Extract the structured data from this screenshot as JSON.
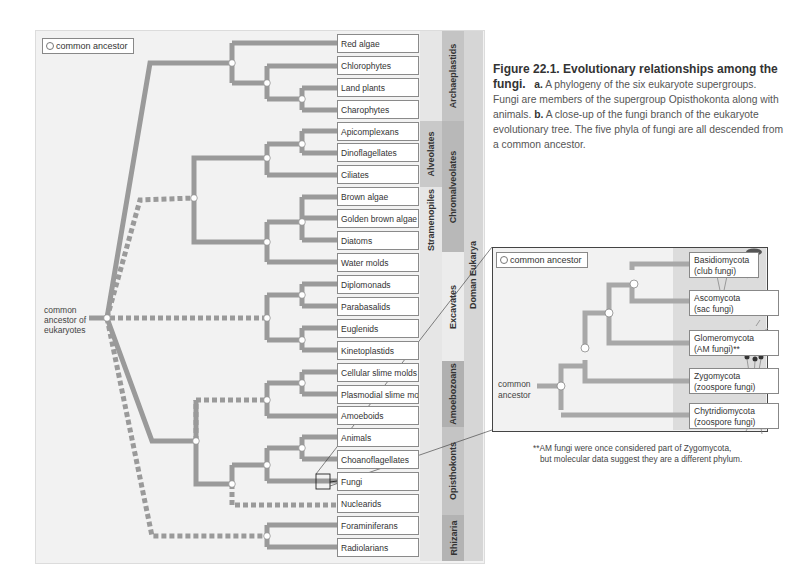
{
  "panel_a": {
    "legend_label": "common ancestor",
    "root_label": "common ancestor of eukaryotes",
    "root_lines": [
      "common",
      "ancestor of",
      "eukaryotes"
    ],
    "taxa": [
      "Red algae",
      "Chlorophytes",
      "Land plants",
      "Charophytes",
      "Apicomplexans",
      "Dinoflagellates",
      "Ciliates",
      "Brown algae",
      "Golden brown algae",
      "Diatoms",
      "Water molds",
      "Diplomonads",
      "Parabasalids",
      "Euglenids",
      "Kinetoplastids",
      "Cellular slime molds",
      "Plasmodial slime molds",
      "Amoeboids",
      "Animals",
      "Choanoflagellates",
      "Fungi",
      "Nuclearids",
      "Foraminiferans",
      "Radiolarians"
    ],
    "subgroups": {
      "alveolates": "Alveolates",
      "stramenopiles": "Stramenopiles"
    },
    "supergroups": {
      "archaeplastids": "Archaeplastids",
      "chromalveolates": "Chromalveolates",
      "excavates": "Excavates",
      "amoebozoans": "Amoebozoans",
      "opisthokonts": "Opisthokonts",
      "rhizaria": "Rhizaria"
    },
    "domain_label": "Doman Eukarya"
  },
  "caption": {
    "figure_title": "Figure 22.1. Evolutionary relationships among the fungi.",
    "part_a_label": "a.",
    "part_a_text": "A phylogeny of the six eukaryote supergroups. Fungi are members of the supergroup Opisthokonta along with animals.",
    "part_b_label": "b.",
    "part_b_text": "A close-up of the fungi branch of the eukaryote evolutionary tree. The five phyla of fungi are all descended from a common ancestor."
  },
  "panel_b": {
    "legend_label": "common ancestor",
    "root_lines": [
      "common",
      "ancestor"
    ],
    "phyla": [
      {
        "name": "Basidiomycota",
        "common": "(club fungi)"
      },
      {
        "name": "Ascomycota",
        "common": "(sac fungi)"
      },
      {
        "name": "Glomeromycota",
        "common": "(AM fungi)**"
      },
      {
        "name": "Zygomycota",
        "common": "(zoospore fungi)"
      },
      {
        "name": "Chytridiomycota",
        "common": "(zoospore fungi)"
      }
    ],
    "footnote_line1": "**AM fungi were once considered part of Zygomycota,",
    "footnote_line2": "but molecular data suggest they are a different phylum."
  },
  "colors": {
    "branch": "#9a9a9a",
    "panel_bg": "#f2f2f2",
    "band_light": "#e3e3e3",
    "band_mid": "#cfcfcf",
    "band_dark": "#b5b5b5",
    "node_fill": "#ffffff"
  }
}
